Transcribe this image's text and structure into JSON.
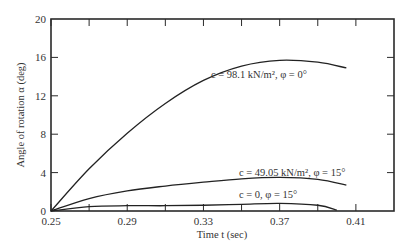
{
  "chart_data": {
    "type": "line",
    "title": "",
    "xlabel": "Time t (sec)",
    "ylabel": "Angle of rotation α (deg)",
    "xlim": [
      0.25,
      0.43
    ],
    "ylim": [
      0,
      20
    ],
    "x_ticks": [
      0.25,
      0.29,
      0.33,
      0.37,
      0.41
    ],
    "x_tick_labels": [
      "0.25",
      "0.29",
      "0.33",
      "0.37",
      "0.41"
    ],
    "x_minor_ticks": [
      0.27,
      0.31,
      0.35,
      0.39
    ],
    "y_ticks": [
      0,
      4,
      8,
      12,
      16,
      20
    ],
    "y_tick_labels": [
      "0",
      "4",
      "8",
      "12",
      "16",
      "20"
    ],
    "grid": false,
    "legend": "inline annotations",
    "series": [
      {
        "name": "c = 98.1 kN/m², φ = 0°",
        "x": [
          0.25,
          0.27,
          0.29,
          0.31,
          0.33,
          0.35,
          0.37,
          0.39,
          0.405
        ],
        "values": [
          0,
          4.4,
          8.1,
          11.2,
          13.6,
          15.1,
          15.7,
          15.5,
          14.9
        ]
      },
      {
        "name": "c = 49.05 kN/m², φ = 15°",
        "x": [
          0.25,
          0.27,
          0.29,
          0.31,
          0.33,
          0.35,
          0.37,
          0.39,
          0.405
        ],
        "values": [
          0,
          1.3,
          2.1,
          2.6,
          3.0,
          3.35,
          3.5,
          3.3,
          2.7
        ]
      },
      {
        "name": "c = 0, φ = 15°",
        "x": [
          0.25,
          0.27,
          0.29,
          0.31,
          0.33,
          0.35,
          0.37,
          0.39,
          0.4
        ],
        "values": [
          0,
          0.45,
          0.55,
          0.55,
          0.6,
          0.7,
          0.8,
          0.6,
          0.1
        ]
      }
    ]
  },
  "labels": {
    "xlabel": "Time t (sec)",
    "ylabel": "Angle of rotation α (deg)",
    "annot1": "c = 98.1 kN/m², φ = 0°",
    "annot2": "c = 49.05 kN/m², φ = 15°",
    "annot3": "c = 0, φ = 15°"
  }
}
